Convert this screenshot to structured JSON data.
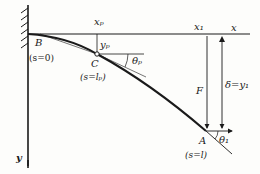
{
  "figure": {
    "colors": {
      "ink": "#1a1a1a",
      "paper": "#fdfdfb"
    }
  },
  "labels": {
    "x_axis": "x",
    "y_axis": "y",
    "x_p": "xₚ",
    "y_p": "yₚ",
    "x_1": "x₁",
    "point_B": "B",
    "point_C": "C",
    "point_A": "A",
    "s_B": "(s=0)",
    "s_C": "(s=lₚ)",
    "s_A": "(s=l)",
    "theta_p": "θₚ",
    "theta_1": "θ₁",
    "force": "F",
    "delta": "δ=y₁"
  }
}
